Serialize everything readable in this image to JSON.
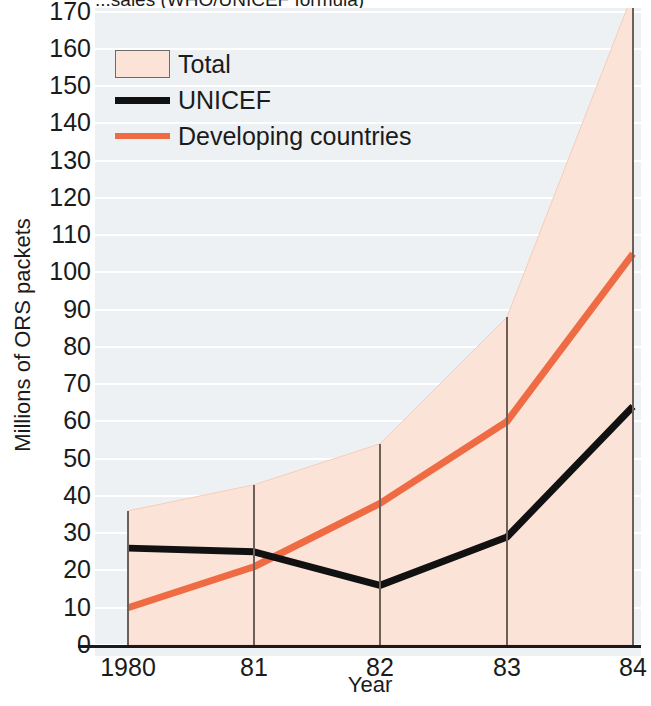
{
  "chart_data": {
    "type": "area",
    "title": "...sales (WHO/UNICEF formula)",
    "xlabel": "Year",
    "ylabel": "Millions of ORS packets",
    "x": [
      1980,
      1981,
      1982,
      1983,
      1984
    ],
    "xtick_labels": [
      "1980",
      "81",
      "82",
      "83",
      "84"
    ],
    "ytick_labels": [
      "0",
      "10",
      "20",
      "30",
      "40",
      "50",
      "60",
      "70",
      "80",
      "90",
      "100",
      "110",
      "120",
      "130",
      "140",
      "150",
      "160",
      "170"
    ],
    "ylim": [
      0,
      170
    ],
    "xlim": [
      1980,
      1984
    ],
    "grid": true,
    "legend_position": "top-left",
    "series": [
      {
        "name": "Total",
        "kind": "area",
        "color": "#fbe3d7",
        "values": [
          36,
          43,
          54,
          88,
          175
        ]
      },
      {
        "name": "UNICEF",
        "kind": "line",
        "color": "#111111",
        "values": [
          26,
          25,
          16,
          29,
          64
        ]
      },
      {
        "name": "Developing countries",
        "kind": "line",
        "color": "#ef6b43",
        "values": [
          10,
          21,
          38,
          60,
          105
        ]
      }
    ]
  },
  "legend": {
    "items": [
      {
        "label": "Total",
        "swatch": "filled-box"
      },
      {
        "label": "UNICEF",
        "swatch": "black-line"
      },
      {
        "label": "Developing countries",
        "swatch": "orange-line"
      }
    ]
  },
  "axes": {
    "y_title": "Millions of ORS packets",
    "x_title": "Year"
  },
  "colors": {
    "area_fill": "#fbe3d7",
    "unicef_line": "#111111",
    "developing_line": "#ef6b43",
    "plot_background": "#eef1f4",
    "gridline": "#ffffff",
    "axis": "#1a1a1a",
    "year_marker": "#6e6057"
  }
}
